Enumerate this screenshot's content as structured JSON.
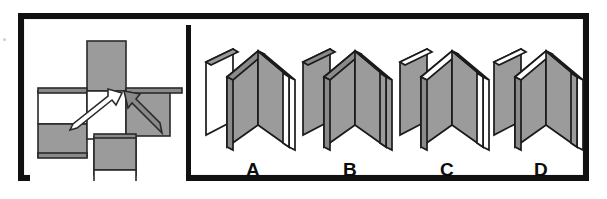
{
  "item": {
    "type": "spatial-reasoning-folding",
    "panels": 2
  },
  "colors": {
    "frame": "#111111",
    "paper": "#ffffff",
    "face_gray": "#9b9b9b",
    "face_gray_dark": "#8a8a8a",
    "face_white": "#ffffff",
    "outline": "#1a1a1a",
    "label_text": "#0b0b0b"
  },
  "stimulus": {
    "name": "unfolded-net",
    "description": "Unfolded net of a folded panel object with two fold-direction arrows",
    "cells": [
      {
        "id": "cell-top",
        "fill": "gray",
        "col": 2,
        "row": 1
      },
      {
        "id": "cell-left-upper",
        "fill": "white",
        "col": 1,
        "row": 2
      },
      {
        "id": "cell-left-lower",
        "fill": "gray",
        "col": 1,
        "row": 3
      },
      {
        "id": "cell-center",
        "fill": "white",
        "col": 2,
        "row": 2
      },
      {
        "id": "cell-right-upper",
        "fill": "gray",
        "col": 3,
        "row": 2
      },
      {
        "id": "cell-mid-lower",
        "fill": "gray",
        "col": 2,
        "row": 3
      },
      {
        "id": "cell-bottom",
        "fill": "white",
        "col": 2,
        "row": 4
      }
    ],
    "arrows": [
      {
        "id": "arrow-left",
        "direction": "up-right",
        "style": "outline"
      },
      {
        "id": "arrow-right",
        "direction": "up-left",
        "style": "filled-gray"
      }
    ]
  },
  "options": {
    "heading": "",
    "items": [
      {
        "label": "A",
        "name": "option-a",
        "panels": [
          {
            "pos": "far-left",
            "face": "white"
          },
          {
            "pos": "inner-left",
            "face": "gray"
          },
          {
            "pos": "inner-right",
            "face": "gray"
          },
          {
            "pos": "far-right",
            "face": "white"
          }
        ],
        "top_edges": "gray"
      },
      {
        "label": "B",
        "name": "option-b",
        "panels": [
          {
            "pos": "far-left",
            "face": "gray"
          },
          {
            "pos": "inner-left",
            "face": "gray"
          },
          {
            "pos": "inner-right",
            "face": "gray"
          },
          {
            "pos": "far-right",
            "face": "gray"
          }
        ],
        "top_edges": "gray"
      },
      {
        "label": "C",
        "name": "option-c",
        "panels": [
          {
            "pos": "far-left",
            "face": "gray"
          },
          {
            "pos": "inner-left",
            "face": "gray"
          },
          {
            "pos": "inner-right",
            "face": "gray"
          },
          {
            "pos": "far-right",
            "face": "white"
          }
        ],
        "top_edges": "white"
      },
      {
        "label": "D",
        "name": "option-d",
        "panels": [
          {
            "pos": "far-left",
            "face": "gray"
          },
          {
            "pos": "inner-left",
            "face": "gray"
          },
          {
            "pos": "inner-right",
            "face": "gray"
          },
          {
            "pos": "far-right",
            "face": "white"
          }
        ],
        "top_edges": "white"
      }
    ]
  }
}
